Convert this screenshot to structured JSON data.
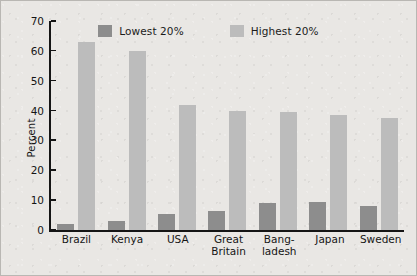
{
  "figure": {
    "background_color": "#e9e7e4",
    "border_color": "#b9b7b3",
    "axis_color": "#151515"
  },
  "legend": {
    "position": "top-center",
    "entries": [
      {
        "label": "Lowest 20%",
        "color": "#8d8d8d"
      },
      {
        "label": "Highest 20%",
        "color": "#bcbcbc"
      }
    ]
  },
  "yaxis": {
    "title": "Percent",
    "ticks": [
      {
        "label": "0",
        "value": 0
      },
      {
        "label": "10",
        "value": 10
      },
      {
        "label": "20",
        "value": 20
      },
      {
        "label": "30",
        "value": 30
      },
      {
        "label": "40",
        "value": 40
      },
      {
        "label": "50",
        "value": 50
      },
      {
        "label": "60",
        "value": 60
      },
      {
        "label": "70",
        "value": 70
      }
    ]
  },
  "categories_display": [
    [
      "Brazil"
    ],
    [
      "Kenya"
    ],
    [
      "USA"
    ],
    [
      "Great",
      "Britain"
    ],
    [
      "Bang-",
      "ladesh"
    ],
    [
      "Japan"
    ],
    [
      "Sweden"
    ]
  ],
  "chart_data": {
    "type": "bar",
    "title": "",
    "subtitle": "",
    "xlabel": "",
    "ylabel": "Percent",
    "ylim": [
      0,
      70
    ],
    "ytick_step": 10,
    "grid": false,
    "legend_position": "top-center",
    "categories": [
      "Brazil",
      "Kenya",
      "USA",
      "Great Britain",
      "Bangladesh",
      "Japan",
      "Sweden"
    ],
    "series": [
      {
        "name": "Lowest 20%",
        "color": "#8d8d8d",
        "values": [
          2,
          3,
          5.5,
          6.5,
          9,
          9.5,
          8
        ]
      },
      {
        "name": "Highest 20%",
        "color": "#bcbcbc",
        "values": [
          63,
          60,
          42,
          40,
          39.5,
          38.5,
          37.5
        ]
      }
    ],
    "annotations": []
  }
}
